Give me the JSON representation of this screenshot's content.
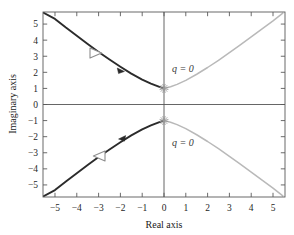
{
  "figure": {
    "kind": "root-locus-plot",
    "background": "#ffffff",
    "frame_color": "#5a5a5a"
  },
  "axes": {
    "x_title": "Real axis",
    "y_title": "Imaginary axis",
    "x_ticks": [
      "-5",
      "-4",
      "-3",
      "-2",
      "-1",
      "0",
      "1",
      "2",
      "3",
      "4",
      "5"
    ],
    "y_ticks": [
      "5",
      "4",
      "3",
      "2",
      "1",
      "0",
      "-1",
      "-2",
      "-3",
      "-4",
      "-5"
    ],
    "xlim": [
      -5.55,
      5.55
    ],
    "ylim": [
      -5.75,
      5.75
    ],
    "grid": false
  },
  "annotations": {
    "upper_branch_label": "q = 0",
    "lower_branch_label": "q = 0"
  },
  "colors": {
    "dark_branch": "#2b2b2b",
    "light_branch": "#b9b9b9",
    "marker": "#9a9a9a",
    "axis_line": "#555555"
  },
  "chart_data": {
    "type": "line",
    "title": "",
    "xlabel": "Real axis",
    "ylabel": "Imaginary axis",
    "xlim": [
      -5.55,
      5.55
    ],
    "ylim": [
      -5.75,
      5.75
    ],
    "grid": false,
    "markers": [
      {
        "name": "asterisk-upper",
        "x": 0,
        "y": 1,
        "symbol": "asterisk"
      },
      {
        "name": "asterisk-lower",
        "x": 0,
        "y": -1,
        "symbol": "asterisk"
      }
    ],
    "arrows": [
      {
        "name": "arrow-upper-left",
        "x": -3.05,
        "y": 3.2,
        "direction": "left",
        "branch": "dark-upper"
      },
      {
        "name": "arrow-lower-left",
        "x": -3.05,
        "y": -3.2,
        "direction": "right",
        "branch": "dark-lower"
      },
      {
        "name": "arrowhead-upper-mid",
        "x": -1.95,
        "y": 2.1,
        "direction": "left",
        "branch": "dark-upper"
      },
      {
        "name": "arrowhead-lower-mid",
        "x": -1.95,
        "y": -2.1,
        "direction": "right",
        "branch": "dark-lower"
      }
    ],
    "series": [
      {
        "name": "dark-upper-branch",
        "color": "#2b2b2b",
        "x": [
          -5.55,
          -5.0,
          -4.5,
          -4.0,
          -3.5,
          -3.0,
          -2.5,
          -2.0,
          -1.5,
          -1.0,
          -0.6,
          -0.3,
          -0.12,
          0.0
        ],
        "y": [
          5.72,
          5.32,
          4.78,
          4.27,
          3.76,
          3.27,
          2.8,
          2.35,
          1.92,
          1.55,
          1.3,
          1.14,
          1.05,
          1.0
        ]
      },
      {
        "name": "dark-lower-branch",
        "color": "#2b2b2b",
        "x": [
          -5.55,
          -5.0,
          -4.5,
          -4.0,
          -3.5,
          -3.0,
          -2.5,
          -2.0,
          -1.5,
          -1.0,
          -0.6,
          -0.3,
          -0.12,
          0.0
        ],
        "y": [
          -5.72,
          -5.32,
          -4.78,
          -4.27,
          -3.76,
          -3.27,
          -2.8,
          -2.35,
          -1.92,
          -1.55,
          -1.3,
          -1.14,
          -1.05,
          -1.0
        ]
      },
      {
        "name": "light-upper-branch",
        "color": "#b9b9b9",
        "x": [
          0.0,
          0.3,
          0.6,
          1.0,
          1.5,
          2.0,
          2.5,
          3.0,
          3.5,
          4.0,
          4.5,
          5.0,
          5.45
        ],
        "y": [
          1.0,
          1.1,
          1.25,
          1.5,
          1.88,
          2.3,
          2.75,
          3.22,
          3.7,
          4.2,
          4.7,
          5.2,
          5.68
        ]
      },
      {
        "name": "light-lower-branch",
        "color": "#b9b9b9",
        "x": [
          0.0,
          0.3,
          0.6,
          1.0,
          1.5,
          2.0,
          2.5,
          3.0,
          3.5,
          4.0,
          4.5,
          5.0,
          5.45
        ],
        "y": [
          -1.0,
          -1.1,
          -1.25,
          -1.5,
          -1.88,
          -2.3,
          -2.75,
          -3.22,
          -3.7,
          -4.2,
          -4.7,
          -5.2,
          -5.68
        ]
      }
    ]
  }
}
